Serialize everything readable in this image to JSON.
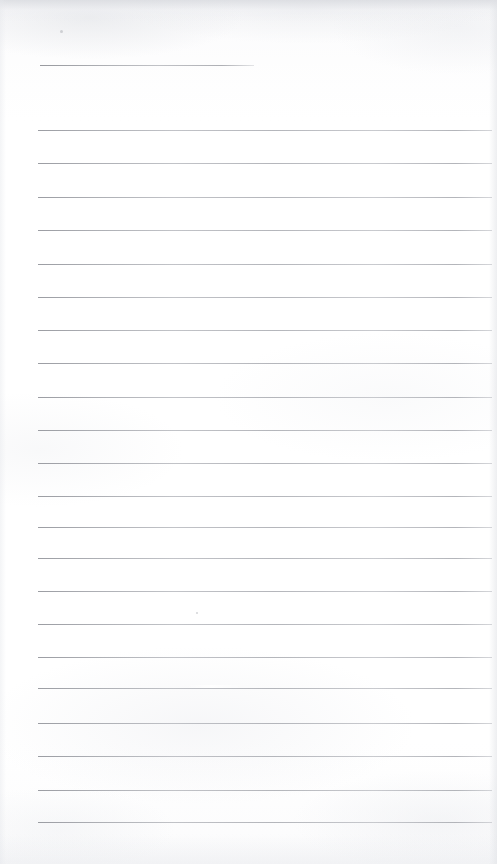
{
  "document": {
    "kind": "scanned-lined-paper",
    "title": "Blank ruled notebook page",
    "page_width": 497,
    "page_height": 864,
    "visible_text": "",
    "paper_color": "#fefefe",
    "rule_color": "#b0b2b8",
    "shade_color": "#d6d8dd"
  },
  "ruling": {
    "left_margin_x": 38,
    "right_end_x": 492,
    "line_spacing": 33.2,
    "short_rule_end_x": 254,
    "total_rules": 23,
    "rules": [
      {
        "name": "rule-header",
        "y": 65,
        "x": 40,
        "width": 214,
        "variant": "short"
      },
      {
        "name": "rule-01",
        "y": 130,
        "x": 38,
        "width": 454,
        "variant": "full"
      },
      {
        "name": "rule-02",
        "y": 163,
        "x": 38,
        "width": 454,
        "variant": "full"
      },
      {
        "name": "rule-03",
        "y": 197,
        "x": 38,
        "width": 454,
        "variant": "full"
      },
      {
        "name": "rule-04",
        "y": 230,
        "x": 38,
        "width": 454,
        "variant": "full"
      },
      {
        "name": "rule-05",
        "y": 264,
        "x": 38,
        "width": 454,
        "variant": "full"
      },
      {
        "name": "rule-06",
        "y": 297,
        "x": 38,
        "width": 454,
        "variant": "full"
      },
      {
        "name": "rule-07",
        "y": 330,
        "x": 38,
        "width": 454,
        "variant": "full"
      },
      {
        "name": "rule-08",
        "y": 363,
        "x": 38,
        "width": 454,
        "variant": "full"
      },
      {
        "name": "rule-09",
        "y": 397,
        "x": 38,
        "width": 454,
        "variant": "full"
      },
      {
        "name": "rule-10",
        "y": 430,
        "x": 38,
        "width": 454,
        "variant": "full"
      },
      {
        "name": "rule-11",
        "y": 463,
        "x": 38,
        "width": 454,
        "variant": "full"
      },
      {
        "name": "rule-12",
        "y": 496,
        "x": 38,
        "width": 454,
        "variant": "full"
      },
      {
        "name": "rule-13",
        "y": 527,
        "x": 38,
        "width": 454,
        "variant": "full"
      },
      {
        "name": "rule-14",
        "y": 558,
        "x": 38,
        "width": 454,
        "variant": "full"
      },
      {
        "name": "rule-15",
        "y": 591,
        "x": 38,
        "width": 454,
        "variant": "full"
      },
      {
        "name": "rule-16",
        "y": 624,
        "x": 38,
        "width": 454,
        "variant": "full"
      },
      {
        "name": "rule-17",
        "y": 657,
        "x": 38,
        "width": 454,
        "variant": "full"
      },
      {
        "name": "rule-18",
        "y": 688,
        "x": 38,
        "width": 454,
        "variant": "full"
      },
      {
        "name": "rule-19",
        "y": 723,
        "x": 38,
        "width": 454,
        "variant": "full"
      },
      {
        "name": "rule-20",
        "y": 756,
        "x": 38,
        "width": 454,
        "variant": "full"
      },
      {
        "name": "rule-21",
        "y": 790,
        "x": 38,
        "width": 454,
        "variant": "full"
      },
      {
        "name": "rule-22",
        "y": 822,
        "x": 38,
        "width": 454,
        "variant": "full"
      }
    ]
  },
  "artifacts": {
    "rule_gap": {
      "x": 186,
      "y": 686,
      "width": 58
    },
    "specks": [
      {
        "name": "speck-top",
        "x": 60,
        "y": 30,
        "size": 3
      },
      {
        "name": "speck-mid",
        "x": 196,
        "y": 612,
        "size": 2
      }
    ]
  }
}
